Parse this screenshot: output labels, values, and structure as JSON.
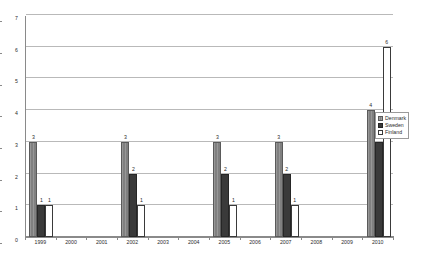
{
  "chart_data": {
    "type": "bar",
    "title": "",
    "subtitle": "",
    "xlabel": "",
    "ylabel": "",
    "ylim": [
      0,
      7
    ],
    "ytick_labels": [
      "0",
      "1",
      "2",
      "3",
      "4",
      "5",
      "6",
      "7"
    ],
    "grid": true,
    "legend_position": "right",
    "categories": [
      "1999",
      "2000",
      "2001",
      "2002",
      "2003",
      "2004",
      "2005",
      "2006",
      "2007",
      "2008",
      "2009",
      "2010"
    ],
    "series": [
      {
        "name": "Denmark",
        "color": "#808080",
        "values": [
          3,
          0,
          0,
          3,
          0,
          0,
          3,
          0,
          3,
          0,
          0,
          4
        ],
        "labels": [
          "3",
          "",
          "",
          "3",
          "",
          "",
          "3",
          "",
          "3",
          "",
          "",
          "4"
        ]
      },
      {
        "name": "Sweden",
        "color": "#3a3a3a",
        "values": [
          1,
          0,
          0,
          2,
          0,
          0,
          2,
          0,
          2,
          0,
          0,
          3
        ],
        "labels": [
          "1",
          "",
          "",
          "2",
          "",
          "",
          "2",
          "",
          "2",
          "",
          "",
          "3"
        ]
      },
      {
        "name": "Finland",
        "color": "#ffffff",
        "values": [
          1,
          0,
          0,
          1,
          0,
          0,
          1,
          0,
          1,
          0,
          0,
          6
        ],
        "labels": [
          "1",
          "",
          "",
          "1",
          "",
          "",
          "1",
          "",
          "1",
          "",
          "",
          "6"
        ]
      }
    ]
  },
  "legend": {
    "items": [
      {
        "label": "Denmark",
        "swatch": "denmark"
      },
      {
        "label": "Sweden",
        "swatch": "sweden"
      },
      {
        "label": "Finland",
        "swatch": "finland"
      }
    ]
  },
  "colors": {
    "denmark": "#808080",
    "sweden": "#3a3a3a",
    "finland": "#ffffff",
    "axis": "#8a8a8a",
    "gridline": "#b9b9b9",
    "text": "#2b2b2b",
    "background": "#ffffff"
  }
}
